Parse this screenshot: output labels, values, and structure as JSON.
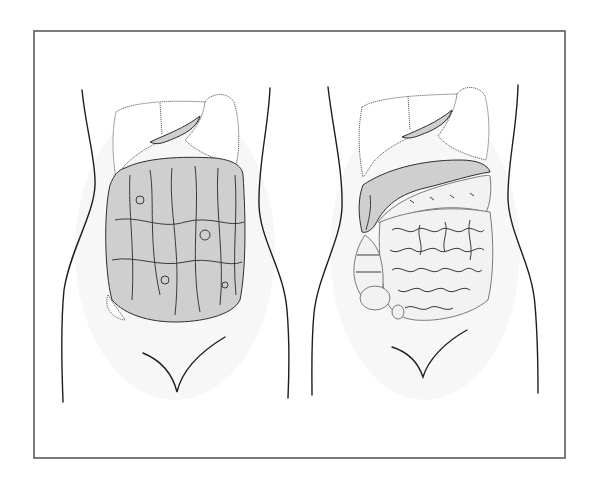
{
  "figure": {
    "frame": {
      "x": 34,
      "y": 31,
      "width": 531,
      "height": 427,
      "stroke_color": "#5a5a5a"
    },
    "panels": [
      {
        "id": "left",
        "label": "",
        "content": "Liver and stomach at top; greater omentum heavily thickened and nodular, covering entire lower abdomen",
        "organs": [
          "liver",
          "stomach",
          "greater-omentum-thickened"
        ],
        "dominant_color": "#2e2e2e"
      },
      {
        "id": "right",
        "label": "",
        "content": "Liver and stomach at top; omentum as band over transverse colon; small intestine loops and colon exposed",
        "organs": [
          "liver",
          "stomach",
          "omentum-band",
          "transverse-colon",
          "small-intestine",
          "ascending-colon",
          "cecum"
        ],
        "dominant_color": "#7a7a7a"
      }
    ],
    "colors": {
      "background": "#ffffff",
      "line": "#1e1e1e",
      "organ_fill": "#f2f2f2"
    }
  }
}
